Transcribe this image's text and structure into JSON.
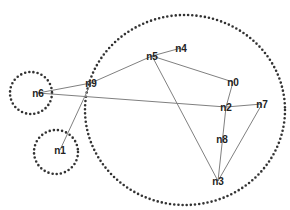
{
  "diagram": {
    "type": "network-graph",
    "colors": {
      "edge": "#808080",
      "cluster": "#333333",
      "label": "#222222",
      "background": "#ffffff"
    },
    "nodes": [
      {
        "id": "n0",
        "label": "n0",
        "x": 233,
        "y": 82
      },
      {
        "id": "n1",
        "label": "n1",
        "x": 60,
        "y": 150
      },
      {
        "id": "n2",
        "label": "n2",
        "x": 226,
        "y": 107
      },
      {
        "id": "n3",
        "label": "n3",
        "x": 218,
        "y": 181
      },
      {
        "id": "n4",
        "label": "n4",
        "x": 181,
        "y": 48
      },
      {
        "id": "n5",
        "label": "n5",
        "x": 152,
        "y": 56
      },
      {
        "id": "n6",
        "label": "n6",
        "x": 38,
        "y": 93
      },
      {
        "id": "n7",
        "label": "n7",
        "x": 262,
        "y": 104
      },
      {
        "id": "n8",
        "label": "n8",
        "x": 222,
        "y": 139
      },
      {
        "id": "n9",
        "label": "n9",
        "x": 91,
        "y": 83
      }
    ],
    "edges": [
      [
        "n6",
        "n9"
      ],
      [
        "n6",
        "n2"
      ],
      [
        "n9",
        "n5"
      ],
      [
        "n9",
        "n1"
      ],
      [
        "n5",
        "n4"
      ],
      [
        "n5",
        "n0"
      ],
      [
        "n5",
        "n3"
      ],
      [
        "n0",
        "n2"
      ],
      [
        "n2",
        "n7"
      ],
      [
        "n2",
        "n3"
      ],
      [
        "n7",
        "n3"
      ]
    ],
    "clusters": [
      {
        "id": "cluster-main",
        "cx": 185,
        "cy": 110,
        "rx": 100,
        "ry": 95
      },
      {
        "id": "cluster-n6",
        "cx": 31,
        "cy": 93,
        "rx": 21,
        "ry": 21
      },
      {
        "id": "cluster-n1",
        "cx": 56,
        "cy": 152,
        "rx": 22,
        "ry": 22
      }
    ]
  }
}
